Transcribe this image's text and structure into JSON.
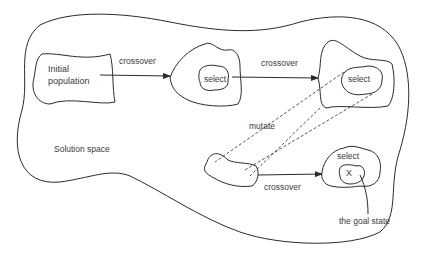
{
  "diagram": {
    "title_region": "Solution space",
    "labels": {
      "initial_population_line1": "Initial",
      "initial_population_line2": "population",
      "crossover_1": "crossover",
      "select_1": "select",
      "crossover_2": "crossover",
      "select_2": "select",
      "mutate": "mutate",
      "solution_space": "Solution space",
      "crossover_3": "crossover",
      "select_3": "select",
      "goal_marker": "X",
      "goal_state": "the goal state"
    },
    "colors": {
      "stroke": "#2b2b2b",
      "text": "#3a3a3a",
      "background": "#ffffff"
    }
  }
}
